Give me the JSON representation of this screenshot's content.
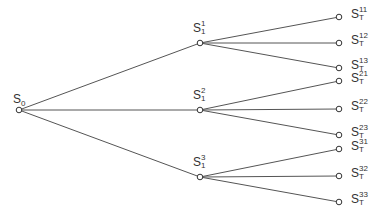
{
  "diagram": {
    "type": "tree",
    "colors": {
      "edge": "#555555",
      "node_stroke": "#333333",
      "node_fill": "#ffffff",
      "text": "#333333"
    },
    "root": {
      "id": "S0",
      "label": "S",
      "sub": "0",
      "sup": "",
      "x": 19,
      "y": 110
    },
    "level1": [
      {
        "id": "S1_1",
        "label": "S",
        "sub": "1",
        "sup": "1",
        "x": 200,
        "y": 43
      },
      {
        "id": "S1_2",
        "label": "S",
        "sub": "1",
        "sup": "2",
        "x": 200,
        "y": 110
      },
      {
        "id": "S1_3",
        "label": "S",
        "sub": "1",
        "sup": "3",
        "x": 200,
        "y": 177
      }
    ],
    "leaves": [
      {
        "id": "ST_11",
        "parent": 0,
        "label": "S",
        "sub": "T",
        "sup": "11",
        "x": 339,
        "y": 17
      },
      {
        "id": "ST_12",
        "parent": 0,
        "label": "S",
        "sub": "T",
        "sup": "12",
        "x": 339,
        "y": 43
      },
      {
        "id": "ST_13",
        "parent": 0,
        "label": "S",
        "sub": "T",
        "sup": "13",
        "x": 339,
        "y": 68
      },
      {
        "id": "ST_21",
        "parent": 1,
        "label": "S",
        "sub": "T",
        "sup": "21",
        "x": 339,
        "y": 81
      },
      {
        "id": "ST_22",
        "parent": 1,
        "label": "S",
        "sub": "T",
        "sup": "22",
        "x": 339,
        "y": 109
      },
      {
        "id": "ST_23",
        "parent": 1,
        "label": "S",
        "sub": "T",
        "sup": "23",
        "x": 339,
        "y": 135
      },
      {
        "id": "ST_31",
        "parent": 2,
        "label": "S",
        "sub": "T",
        "sup": "31",
        "x": 339,
        "y": 149
      },
      {
        "id": "ST_32",
        "parent": 2,
        "label": "S",
        "sub": "T",
        "sup": "32",
        "x": 339,
        "y": 176
      },
      {
        "id": "ST_33",
        "parent": 2,
        "label": "S",
        "sub": "T",
        "sup": "33",
        "x": 339,
        "y": 202
      }
    ]
  }
}
